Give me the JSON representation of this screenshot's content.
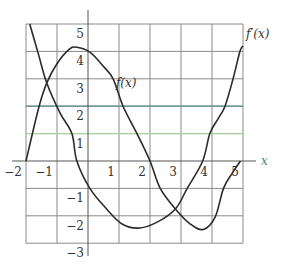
{
  "chart_data": {
    "type": "line",
    "title": "",
    "xlabel": "x",
    "ylabel": "",
    "xlim": [
      -2,
      5
    ],
    "ylim": [
      -3,
      5
    ],
    "grid": true,
    "legend": "inline labels",
    "x_ticks": [
      -2,
      -1,
      1,
      2,
      3,
      4,
      5
    ],
    "y_ticks": [
      5,
      4,
      3,
      2,
      1,
      -1,
      -2,
      -3
    ],
    "x_tick_labels": [
      "−2",
      "−1",
      "1",
      "2",
      "3",
      "4",
      "5"
    ],
    "y_tick_labels": [
      "5",
      "4",
      "3",
      "2",
      "1",
      "−1",
      "−2",
      "−3"
    ],
    "highlight_lines": [
      {
        "y": 2,
        "color": "#5e8f8a"
      },
      {
        "y": 1,
        "color": "#a8d4a0"
      }
    ],
    "series": [
      {
        "name": "f(x)",
        "label": "f(x)",
        "label_position": {
          "x": 0.9,
          "y": 2.7
        },
        "points": [
          [
            -2.0,
            0.0
          ],
          [
            -1.6,
            1.9
          ],
          [
            -1.33,
            2.85
          ],
          [
            -1.0,
            3.55
          ],
          [
            -0.6,
            4.08
          ],
          [
            -0.36,
            4.15
          ],
          [
            0.06,
            3.97
          ],
          [
            0.5,
            3.45
          ],
          [
            0.81,
            3.0
          ],
          [
            1.13,
            2.0
          ],
          [
            1.58,
            1.0
          ],
          [
            2.0,
            0.0
          ],
          [
            2.33,
            -1.0
          ],
          [
            2.82,
            -1.75
          ],
          [
            3.3,
            -2.3
          ],
          [
            3.72,
            -2.5
          ],
          [
            4.1,
            -2.05
          ],
          [
            4.37,
            -1.0
          ],
          [
            4.65,
            -0.45
          ],
          [
            4.92,
            0.0
          ]
        ]
      },
      {
        "name": "f'(x)",
        "label": "f′(x)",
        "label_position": {
          "x": 5.1,
          "y": 4.5
        },
        "points": [
          [
            -1.88,
            5.0
          ],
          [
            -1.6,
            3.9
          ],
          [
            -1.33,
            2.85
          ],
          [
            -0.9,
            1.75
          ],
          [
            -0.52,
            1.0
          ],
          [
            -0.36,
            0.0
          ],
          [
            0.06,
            -1.0
          ],
          [
            0.6,
            -1.75
          ],
          [
            1.1,
            -2.3
          ],
          [
            1.62,
            -2.45
          ],
          [
            2.2,
            -2.25
          ],
          [
            2.82,
            -1.75
          ],
          [
            3.2,
            -1.0
          ],
          [
            3.7,
            0.0
          ],
          [
            3.93,
            1.0
          ],
          [
            4.2,
            1.55
          ],
          [
            4.42,
            2.0
          ],
          [
            4.68,
            3.0
          ],
          [
            4.9,
            4.0
          ],
          [
            5.0,
            4.2
          ]
        ]
      }
    ]
  }
}
